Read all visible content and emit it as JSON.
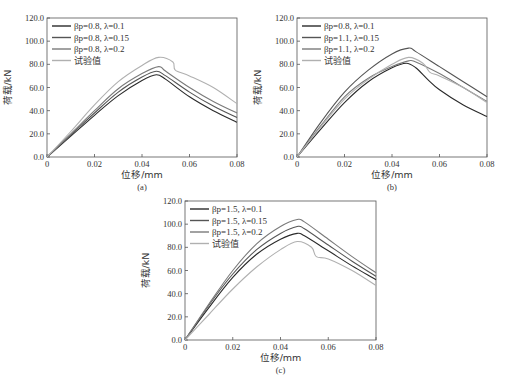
{
  "chart_data": [
    {
      "type": "line",
      "panel": "(a)",
      "xlabel": "位移/mm",
      "ylabel": "荷载/kN",
      "xlim": [
        0,
        0.08
      ],
      "ylim": [
        0,
        120
      ],
      "xticks": [
        "0",
        "0.02",
        "0.04",
        "0.06",
        "0.08"
      ],
      "yticks": [
        "0.0",
        "20.0",
        "40.0",
        "60.0",
        "80.0",
        "100.0",
        "120.0"
      ],
      "legend_position": "upper left",
      "grid": false,
      "series": [
        {
          "name": "βp=0.8, λ=0.1",
          "color": "#2a2a2a",
          "points": [
            [
              0,
              0
            ],
            [
              0.01,
              18
            ],
            [
              0.02,
              36
            ],
            [
              0.03,
              53
            ],
            [
              0.04,
              66
            ],
            [
              0.046,
              71
            ],
            [
              0.05,
              67
            ],
            [
              0.06,
              52
            ],
            [
              0.07,
              40
            ],
            [
              0.08,
              30
            ]
          ]
        },
        {
          "name": "βp=0.8, λ=0.15",
          "color": "#555555",
          "points": [
            [
              0,
              0
            ],
            [
              0.01,
              19
            ],
            [
              0.02,
              38
            ],
            [
              0.03,
              56
            ],
            [
              0.04,
              69
            ],
            [
              0.046,
              74
            ],
            [
              0.05,
              70
            ],
            [
              0.06,
              56
            ],
            [
              0.07,
              44
            ],
            [
              0.08,
              34
            ]
          ]
        },
        {
          "name": "βp=0.8, λ=0.2",
          "color": "#7a7a7a",
          "points": [
            [
              0,
              0
            ],
            [
              0.01,
              20
            ],
            [
              0.02,
              40
            ],
            [
              0.03,
              59
            ],
            [
              0.04,
              72
            ],
            [
              0.047,
              78
            ],
            [
              0.05,
              74
            ],
            [
              0.06,
              60
            ],
            [
              0.07,
              48
            ],
            [
              0.08,
              38
            ]
          ]
        },
        {
          "name": "试验值",
          "color": "#b0b0b0",
          "points": [
            [
              0,
              0
            ],
            [
              0.01,
              22
            ],
            [
              0.02,
              45
            ],
            [
              0.03,
              65
            ],
            [
              0.04,
              79
            ],
            [
              0.047,
              86
            ],
            [
              0.053,
              82
            ],
            [
              0.054,
              75
            ],
            [
              0.06,
              70
            ],
            [
              0.07,
              60
            ],
            [
              0.08,
              46
            ]
          ]
        }
      ]
    },
    {
      "type": "line",
      "panel": "(b)",
      "xlabel": "位移/mm",
      "ylabel": "荷载/kN",
      "xlim": [
        0,
        0.08
      ],
      "ylim": [
        0,
        120
      ],
      "xticks": [
        "0",
        "0.02",
        "0.04",
        "0.06",
        "0.08"
      ],
      "yticks": [
        "0.0",
        "20.0",
        "40.0",
        "60.0",
        "80.0",
        "100.0",
        "120.0"
      ],
      "legend_position": "upper left",
      "grid": false,
      "series": [
        {
          "name": "βp=0.8, λ=0.1",
          "color": "#2a2a2a",
          "points": [
            [
              0,
              0
            ],
            [
              0.01,
              24
            ],
            [
              0.02,
              47
            ],
            [
              0.03,
              65
            ],
            [
              0.04,
              77
            ],
            [
              0.046,
              81
            ],
            [
              0.05,
              77
            ],
            [
              0.055,
              67
            ],
            [
              0.06,
              58
            ],
            [
              0.07,
              45
            ],
            [
              0.08,
              35
            ]
          ]
        },
        {
          "name": "βp=1.1, λ=0.15",
          "color": "#555555",
          "points": [
            [
              0,
              0
            ],
            [
              0.01,
              30
            ],
            [
              0.02,
              56
            ],
            [
              0.03,
              75
            ],
            [
              0.04,
              89
            ],
            [
              0.047,
              94
            ],
            [
              0.05,
              91
            ],
            [
              0.06,
              78
            ],
            [
              0.07,
              65
            ],
            [
              0.08,
              52
            ]
          ]
        },
        {
          "name": "βp=1.1, λ=0.2",
          "color": "#7a7a7a",
          "points": [
            [
              0,
              0
            ],
            [
              0.01,
              27
            ],
            [
              0.02,
              52
            ],
            [
              0.03,
              68
            ],
            [
              0.04,
              78
            ],
            [
              0.047,
              83
            ],
            [
              0.05,
              82
            ],
            [
              0.06,
              72
            ],
            [
              0.07,
              60
            ],
            [
              0.08,
              48
            ]
          ]
        },
        {
          "name": "试验值",
          "color": "#b0b0b0",
          "points": [
            [
              0,
              0
            ],
            [
              0.01,
              26
            ],
            [
              0.02,
              50
            ],
            [
              0.03,
              67
            ],
            [
              0.04,
              80
            ],
            [
              0.047,
              86
            ],
            [
              0.053,
              81
            ],
            [
              0.056,
              73
            ],
            [
              0.06,
              70
            ],
            [
              0.07,
              60
            ],
            [
              0.08,
              47
            ]
          ]
        }
      ]
    },
    {
      "type": "line",
      "panel": "(c)",
      "xlabel": "位移/mm",
      "ylabel": "荷载/kN",
      "xlim": [
        0,
        0.08
      ],
      "ylim": [
        0,
        120
      ],
      "xticks": [
        "0",
        "0.02",
        "0.04",
        "0.06",
        "0.08"
      ],
      "yticks": [
        "0.0",
        "20.0",
        "40.0",
        "60.0",
        "80.0",
        "100.0",
        "120.0"
      ],
      "legend_position": "upper left",
      "grid": false,
      "series": [
        {
          "name": "βp=1.5, λ=0.1",
          "color": "#2a2a2a",
          "points": [
            [
              0,
              0
            ],
            [
              0.01,
              28
            ],
            [
              0.02,
              54
            ],
            [
              0.03,
              74
            ],
            [
              0.04,
              87
            ],
            [
              0.047,
              92
            ],
            [
              0.05,
              90
            ],
            [
              0.06,
              77
            ],
            [
              0.07,
              64
            ],
            [
              0.08,
              52
            ]
          ]
        },
        {
          "name": "βp=1.5, λ=0.15",
          "color": "#555555",
          "points": [
            [
              0,
              0
            ],
            [
              0.01,
              30
            ],
            [
              0.02,
              57
            ],
            [
              0.03,
              78
            ],
            [
              0.04,
              92
            ],
            [
              0.047,
              98
            ],
            [
              0.05,
              96
            ],
            [
              0.06,
              82
            ],
            [
              0.07,
              68
            ],
            [
              0.08,
              55
            ]
          ]
        },
        {
          "name": "βp=1.5, λ=0.2",
          "color": "#7a7a7a",
          "points": [
            [
              0,
              0
            ],
            [
              0.01,
              31
            ],
            [
              0.02,
              60
            ],
            [
              0.03,
              83
            ],
            [
              0.04,
              98
            ],
            [
              0.047,
              104
            ],
            [
              0.05,
              102
            ],
            [
              0.06,
              87
            ],
            [
              0.07,
              72
            ],
            [
              0.08,
              58
            ]
          ]
        },
        {
          "name": "试验值",
          "color": "#b0b0b0",
          "points": [
            [
              0,
              0
            ],
            [
              0.01,
              22
            ],
            [
              0.02,
              44
            ],
            [
              0.03,
              63
            ],
            [
              0.04,
              78
            ],
            [
              0.047,
              85
            ],
            [
              0.053,
              80
            ],
            [
              0.055,
              72
            ],
            [
              0.06,
              70
            ],
            [
              0.07,
              60
            ],
            [
              0.08,
              47
            ]
          ]
        }
      ]
    }
  ],
  "panels": [
    {
      "id": "a",
      "caption": "(a)",
      "plot": {
        "x0": 47,
        "x1": 237,
        "y0": 157,
        "y1": 18
      }
    },
    {
      "id": "b",
      "caption": "(b)",
      "plot": {
        "x0": 297,
        "x1": 487,
        "y0": 157,
        "y1": 18
      }
    },
    {
      "id": "c",
      "caption": "(c)",
      "plot": {
        "x0": 185,
        "x1": 376,
        "y0": 340,
        "y1": 201
      }
    }
  ]
}
